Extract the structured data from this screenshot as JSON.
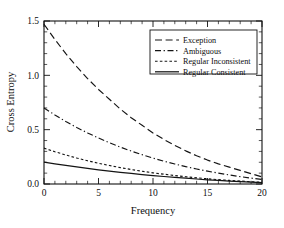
{
  "chart_data": {
    "type": "line",
    "title": "",
    "xlabel": "Frequency",
    "ylabel": "Cross Entropy",
    "xlim": [
      0,
      20
    ],
    "ylim": [
      0.0,
      1.5
    ],
    "xticks": [
      "0",
      "5",
      "10",
      "15",
      "20"
    ],
    "xtick_values": [
      0,
      5,
      10,
      15,
      20
    ],
    "yticks": [
      "0.0",
      "0.5",
      "1.0",
      "1.5"
    ],
    "ytick_values": [
      0.0,
      0.5,
      1.0,
      1.5
    ],
    "grid": false,
    "legend_position": "upper right",
    "x": [
      0,
      1,
      2,
      3,
      4,
      5,
      6,
      7,
      8,
      9,
      10,
      11,
      12,
      13,
      14,
      15,
      16,
      17,
      18,
      19,
      20
    ],
    "series": [
      {
        "name": "Exception",
        "style": "long-dash",
        "color": "#141414",
        "values": [
          1.47,
          1.33,
          1.2,
          1.08,
          0.97,
          0.87,
          0.78,
          0.69,
          0.61,
          0.54,
          0.47,
          0.41,
          0.355,
          0.305,
          0.26,
          0.22,
          0.185,
          0.155,
          0.125,
          0.095,
          0.065
        ]
      },
      {
        "name": "Ambiguous",
        "style": "dash-dot",
        "color": "#141414",
        "values": [
          0.7,
          0.635,
          0.575,
          0.52,
          0.47,
          0.423,
          0.38,
          0.34,
          0.303,
          0.27,
          0.238,
          0.21,
          0.184,
          0.16,
          0.138,
          0.118,
          0.1,
          0.083,
          0.068,
          0.054,
          0.042
        ]
      },
      {
        "name": "Regular Inconsistent",
        "style": "short-dash",
        "color": "#141414",
        "values": [
          0.33,
          0.297,
          0.267,
          0.239,
          0.214,
          0.191,
          0.17,
          0.151,
          0.133,
          0.117,
          0.103,
          0.09,
          0.078,
          0.067,
          0.057,
          0.048,
          0.04,
          0.033,
          0.027,
          0.021,
          0.016
        ]
      },
      {
        "name": "Regular Consistent",
        "style": "solid",
        "color": "#141414",
        "values": [
          0.202,
          0.186,
          0.171,
          0.157,
          0.144,
          0.131,
          0.119,
          0.108,
          0.097,
          0.087,
          0.078,
          0.069,
          0.061,
          0.053,
          0.046,
          0.039,
          0.033,
          0.027,
          0.022,
          0.017,
          0.012
        ]
      }
    ],
    "legend_entries": [
      {
        "label": "Exception",
        "style": "long-dash"
      },
      {
        "label": "Ambiguous",
        "style": "dash-dot"
      },
      {
        "label": "Regular Inconsistent",
        "style": "short-dash"
      },
      {
        "label": "Regular Consistent",
        "style": "solid"
      }
    ]
  },
  "axes": {
    "frame_color": "#111111",
    "xlabel": "Frequency",
    "ylabel": "Cross Entropy"
  }
}
